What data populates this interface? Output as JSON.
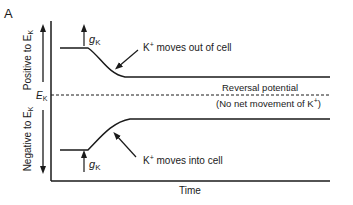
{
  "panel_label": "A",
  "y_axis": {
    "upper_label": "Positive to E",
    "upper_sub": "K",
    "lower_label": "Negative to E",
    "lower_sub": "K",
    "ek_label": "E",
    "ek_sub": "K"
  },
  "x_axis": {
    "label": "Time"
  },
  "annotations": {
    "gk_upper": "g",
    "gk_upper_sub": "K",
    "gk_lower": "g",
    "gk_lower_sub": "K",
    "out_prefix": "K",
    "out_sup": "+",
    "out_text": " moves out of cell",
    "in_prefix": "K",
    "in_sup": "+",
    "in_text": " moves into cell",
    "reversal_line1": "Reversal potential",
    "reversal_line2a": "(No net movement of K",
    "reversal_line2_sup": "+",
    "reversal_line2b": ")"
  },
  "colors": {
    "ink": "#1a1a1a",
    "background": "#ffffff"
  }
}
